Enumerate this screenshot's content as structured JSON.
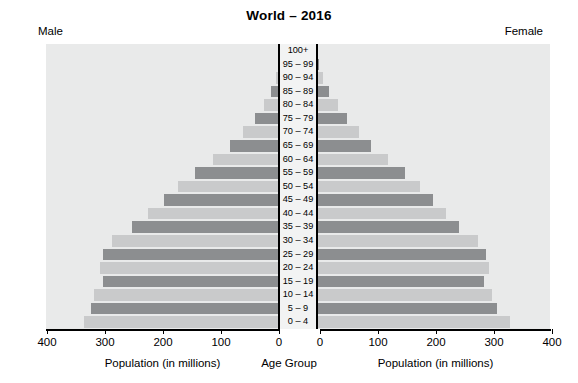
{
  "chart_data": {
    "type": "bar",
    "subtype": "population-pyramid",
    "title": "World – 2016",
    "left_panel_label": "Male",
    "right_panel_label": "Female",
    "xlabel_left": "Population (in millions)",
    "xlabel_right": "Population (in millions)",
    "center_axis_label": "Age Group",
    "ylabel": "Age Group",
    "grid": false,
    "legend": "none",
    "xlim_left": [
      400,
      0
    ],
    "xlim_right": [
      0,
      400
    ],
    "left_ticks": [
      "400",
      "300",
      "200",
      "100",
      "0"
    ],
    "right_ticks": [
      "0",
      "100",
      "200",
      "300",
      "400"
    ],
    "tick_values": [
      0,
      100,
      200,
      300,
      400
    ],
    "units": "millions",
    "categories": [
      "100+",
      "95 – 99",
      "90 – 94",
      "85 – 89",
      "80 – 84",
      "75 – 79",
      "70 – 74",
      "65 – 69",
      "60 – 64",
      "55 – 59",
      "50 – 54",
      "45 – 49",
      "40 – 44",
      "35 – 39",
      "30 – 34",
      "25 – 29",
      "20 – 24",
      "15 – 19",
      "10 – 14",
      "5 – 9",
      "0 – 4"
    ],
    "series": [
      {
        "name": "Male",
        "side": "left",
        "values": [
          0.1,
          1.4,
          5.5,
          14,
          26,
          41,
          62,
          84,
          114,
          145,
          175,
          199,
          226,
          253,
          288,
          304,
          309,
          303,
          319,
          325,
          337
        ]
      },
      {
        "name": "Female",
        "side": "right",
        "values": [
          0.4,
          3.2,
          10,
          21,
          36,
          52,
          73,
          93,
          122,
          151,
          178,
          200,
          222,
          245,
          277,
          291,
          296,
          288,
          302,
          311,
          332
        ]
      }
    ],
    "colors": {
      "bar_light": "#c9cacb",
      "bar_dark": "#8c8e90",
      "panel_background": "#e9eaea",
      "gutter_background": "#f2f3f3",
      "axis": "#000000",
      "page_background": "#ffffff"
    }
  }
}
